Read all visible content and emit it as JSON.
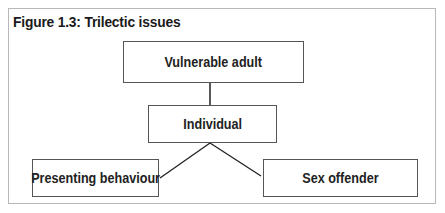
{
  "figure": {
    "title": "Figure 1.3: Trilectic issues"
  },
  "nodes": {
    "top": {
      "label": "Vulnerable adult"
    },
    "middle": {
      "label": "Individual"
    },
    "bottom_left": {
      "label": "Presenting behaviour"
    },
    "bottom_right": {
      "label": "Sex offender"
    }
  },
  "edges": [
    {
      "from": "Vulnerable adult",
      "to": "Individual"
    },
    {
      "from": "Individual",
      "to": "Presenting behaviour"
    },
    {
      "from": "Individual",
      "to": "Sex offender"
    }
  ],
  "colors": {
    "frame_border": "#b8b8b8",
    "box_border": "#555555",
    "line": "#222222",
    "text": "#222222"
  }
}
